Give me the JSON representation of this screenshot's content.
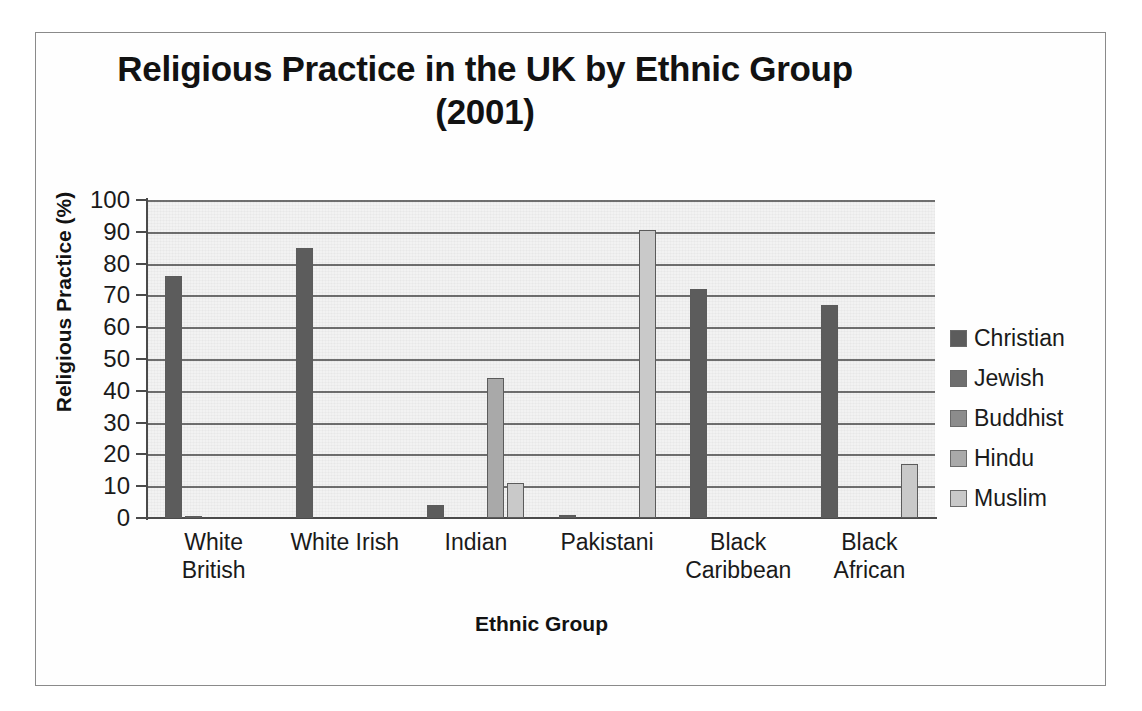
{
  "chart_data": {
    "type": "bar",
    "title": "Religious Practice in the UK by Ethnic Group (2001)",
    "title_line1": "Religious Practice in the UK by Ethnic Group",
    "title_line2": "(2001)",
    "xlabel": "Ethnic Group",
    "ylabel": "Religious Practice (%)",
    "ylim": [
      0,
      100
    ],
    "ytick_step": 10,
    "yticks": [
      "100",
      "90",
      "80",
      "70",
      "60",
      "50",
      "40",
      "30",
      "20",
      "10",
      "0"
    ],
    "grid": true,
    "legend_position": "right",
    "categories": [
      "White British",
      "White Irish",
      "Indian",
      "Pakistani",
      "Black Caribbean",
      "Black African"
    ],
    "category_lines": [
      [
        "White",
        "British"
      ],
      [
        "White Irish",
        ""
      ],
      [
        "Indian",
        ""
      ],
      [
        "Pakistani",
        ""
      ],
      [
        "Black",
        "Caribbean"
      ],
      [
        "Black",
        "African"
      ]
    ],
    "series": [
      {
        "name": "Christian",
        "color": "#5c5c5c",
        "values": [
          76,
          85,
          4,
          1,
          72,
          67
        ]
      },
      {
        "name": "Jewish",
        "color": "#6e6e6e",
        "values": [
          0.5,
          0,
          0,
          0,
          0,
          0
        ]
      },
      {
        "name": "Buddhist",
        "color": "#8c8c8c",
        "values": [
          0,
          0,
          0,
          0,
          0,
          0
        ]
      },
      {
        "name": "Hindu",
        "color": "#a9a9a9",
        "values": [
          0,
          0,
          44,
          0,
          0,
          0
        ]
      },
      {
        "name": "Muslim",
        "color": "#c9c9c9",
        "values": [
          0,
          0,
          11,
          90.5,
          0,
          17
        ]
      }
    ]
  }
}
